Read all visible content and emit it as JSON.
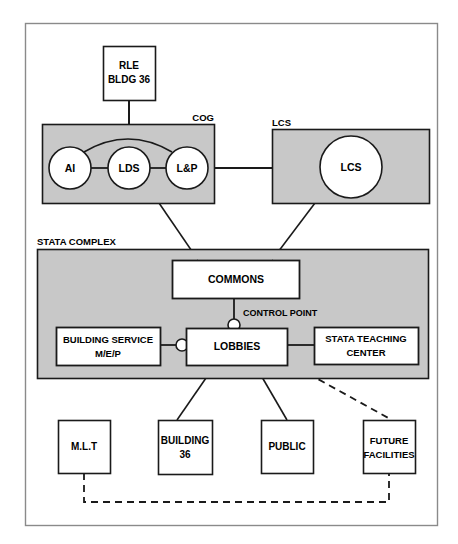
{
  "diagram": {
    "title_text": "",
    "colors": {
      "group_fill": "#c8c8c8",
      "node_fill": "#ffffff",
      "stroke": "#1a1a1a",
      "border": "#8a8a8a",
      "background": "#ffffff"
    },
    "groups": [
      {
        "id": "cog",
        "label": "COG"
      },
      {
        "id": "lcs",
        "label": "LCS"
      },
      {
        "id": "stata",
        "label": "STATA COMPLEX"
      }
    ],
    "nodes": {
      "rle": {
        "line1": "RLE",
        "line2": "BLDG 36"
      },
      "ai": {
        "label": "AI"
      },
      "lds": {
        "label": "LDS"
      },
      "lp": {
        "label": "L&P"
      },
      "lcs_circle": {
        "label": "LCS"
      },
      "commons": {
        "label": "COMMONS"
      },
      "building_service": {
        "line1": "BUILDING SERVICE",
        "line2": "M/E/P"
      },
      "lobbies": {
        "label": "LOBBIES"
      },
      "stata_teaching": {
        "line1": "STATA TEACHING",
        "line2": "CENTER"
      },
      "mlt": {
        "label": "M.L.T"
      },
      "building36": {
        "line1": "BUILDING",
        "line2": "36"
      },
      "public": {
        "label": "PUBLIC"
      },
      "future": {
        "line1": "FUTURE",
        "line2": "FACILITIES"
      }
    },
    "annotations": {
      "control_point": "CONTROL POINT"
    }
  }
}
